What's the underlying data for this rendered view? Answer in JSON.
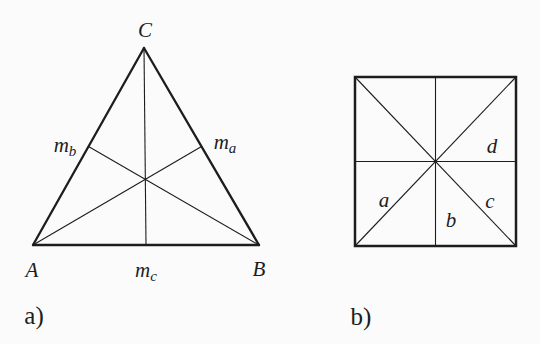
{
  "figure": {
    "background": "#fbfbfb",
    "line_color": "#1d1d1d"
  },
  "panel_a": {
    "caption": "a)",
    "description": "triangle-with-three-medians",
    "vertex_labels": {
      "C": "C",
      "A": "A",
      "B": "B"
    },
    "median_labels": {
      "mb": {
        "base": "m",
        "sub": "b"
      },
      "ma": {
        "base": "m",
        "sub": "a"
      },
      "mc": {
        "base": "m",
        "sub": "c"
      }
    }
  },
  "panel_b": {
    "caption": "b)",
    "description": "square-with-diagonals-and-midlines",
    "segment_labels": {
      "a": "a",
      "b": "b",
      "c": "c",
      "d": "d"
    }
  }
}
